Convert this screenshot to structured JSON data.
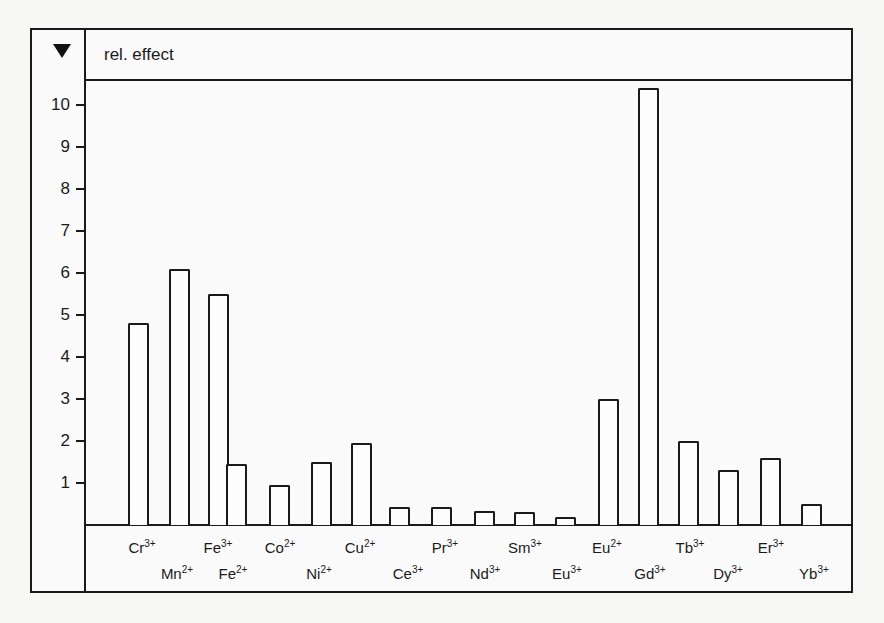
{
  "header": {
    "marker_icon": "down-triangle-icon",
    "title": "rel. effect"
  },
  "colors": {
    "line": "#1a1a1a",
    "background": "#fafafa",
    "bar_fill": "#fdfdfd"
  },
  "chart_data": {
    "type": "bar",
    "title": "rel. effect",
    "xlabel": "",
    "ylabel": "rel. effect",
    "ylim": [
      0,
      10.6
    ],
    "yticks": [
      1,
      2,
      3,
      4,
      5,
      6,
      7,
      8,
      9,
      10
    ],
    "grid": false,
    "legend": null,
    "categories": [
      "Cr3+",
      "Mn2+",
      "Fe3+",
      "Fe2+",
      "Co2+",
      "Ni2+",
      "Cu2+",
      "Ce3+",
      "Pr3+",
      "Nd3+",
      "Sm3+",
      "Eu3+",
      "Eu2+",
      "Gd3+",
      "Tb3+",
      "Dy3+",
      "Er3+",
      "Yb3+"
    ],
    "values": [
      4.8,
      6.1,
      5.5,
      1.45,
      0.95,
      1.5,
      1.95,
      0.42,
      0.42,
      0.33,
      0.3,
      0.2,
      3.0,
      10.4,
      2.0,
      1.3,
      1.6,
      0.5
    ],
    "label_parts": [
      {
        "el": "Cr",
        "ch": "3+",
        "row": 0
      },
      {
        "el": "Mn",
        "ch": "2+",
        "row": 1
      },
      {
        "el": "Fe",
        "ch": "3+",
        "row": 0
      },
      {
        "el": "Fe",
        "ch": "2+",
        "row": 1
      },
      {
        "el": "Co",
        "ch": "2+",
        "row": 0
      },
      {
        "el": "Ni",
        "ch": "2+",
        "row": 1
      },
      {
        "el": "Cu",
        "ch": "2+",
        "row": 0
      },
      {
        "el": "Ce",
        "ch": "3+",
        "row": 1
      },
      {
        "el": "Pr",
        "ch": "3+",
        "row": 0
      },
      {
        "el": "Nd",
        "ch": "3+",
        "row": 1
      },
      {
        "el": "Sm",
        "ch": "3+",
        "row": 0
      },
      {
        "el": "Eu",
        "ch": "3+",
        "row": 1
      },
      {
        "el": "Eu",
        "ch": "2+",
        "row": 0
      },
      {
        "el": "Gd",
        "ch": "3+",
        "row": 1
      },
      {
        "el": "Tb",
        "ch": "3+",
        "row": 0
      },
      {
        "el": "Dy",
        "ch": "3+",
        "row": 1
      },
      {
        "el": "Er",
        "ch": "3+",
        "row": 0
      },
      {
        "el": "Yb",
        "ch": "3+",
        "row": 1
      }
    ],
    "bar_x": [
      128,
      169,
      208,
      226,
      269,
      311,
      351,
      389,
      431,
      474,
      514,
      555,
      598,
      638,
      678,
      718,
      760,
      801
    ],
    "label_x": [
      142,
      177,
      218,
      233,
      280,
      319,
      360,
      408,
      445,
      485,
      525,
      567,
      607,
      650,
      690,
      728,
      771,
      814
    ]
  }
}
